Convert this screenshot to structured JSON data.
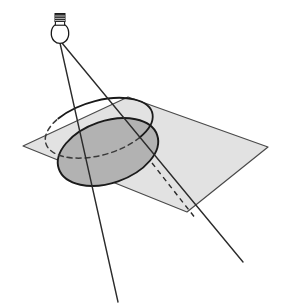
{
  "figure": {
    "background_color": "#ffffff",
    "width": 285,
    "height": 308
  },
  "colors": {
    "stroke": "#1a1a1a",
    "plane_fill": "#e2e2e2",
    "plane_stroke": "#4a4a4a",
    "shadow_fill": "#b2b2b2",
    "shadow_stroke": "#1a1a1a",
    "ring_stroke": "#1a1a1a",
    "ray_stroke": "#2b2b2b",
    "bulb_glass_fill": "#ffffff",
    "bulb_base_fill": "#2e2e2e"
  },
  "light_source": {
    "name": "light-bulb",
    "label": "light bulb",
    "position": {
      "x": 60,
      "y": 40
    },
    "glass": {
      "cx": 60,
      "cy": 35,
      "rx": 8.5,
      "ry": 9.5
    },
    "neck": {
      "x": 55.5,
      "y": 21,
      "width": 9,
      "height": 7
    },
    "base": {
      "x": 55,
      "y": 14,
      "width": 10,
      "height": 8
    },
    "base_ridges": [
      16,
      18.5,
      21
    ]
  },
  "plane": {
    "name": "ground-plane",
    "label": "plane",
    "corners": [
      {
        "x": 128,
        "y": 97
      },
      {
        "x": 268,
        "y": 147
      },
      {
        "x": 187,
        "y": 212
      },
      {
        "x": 23,
        "y": 146
      }
    ]
  },
  "ring": {
    "name": "circle-object",
    "label": "circle (object)",
    "center": {
      "x": 99,
      "y": 128
    },
    "rx": 45,
    "ry": 22,
    "rotation_deg": -16,
    "visible_arc": "M 58.3 118.5 A 45 22 -16 1 1 139.7 137.5",
    "hidden_arc": "M 139.7 137.5 A 45 22 -16 0 1 58.3 118.5"
  },
  "shadow": {
    "name": "shadow-ellipse",
    "label": "shadow (conic section)",
    "center": {
      "x": 108,
      "y": 152
    },
    "rx": 52,
    "ry": 31,
    "rotation_deg": -19
  },
  "rays": [
    {
      "name": "light-ray-left",
      "label": "tangent light ray (left)",
      "from": {
        "x": 60,
        "y": 43
      },
      "to": {
        "x": 118,
        "y": 302
      },
      "style": "solid"
    },
    {
      "name": "light-ray-right",
      "label": "tangent light ray (right)",
      "from": {
        "x": 62,
        "y": 43
      },
      "to": {
        "x": 243,
        "y": 262
      },
      "style": "solid"
    }
  ],
  "hidden_ray": {
    "name": "hidden-ray-segment",
    "label": "hidden portion of right ray",
    "from": {
      "x": 152,
      "y": 163
    },
    "to": {
      "x": 196,
      "y": 219
    },
    "style": "dashed",
    "dash_pattern": "5 4"
  },
  "annotations": {
    "description": "A light bulb above a plane. Two tangent rays from the bulb graze a tilted circle and meet the plane, producing a larger elliptical shadow on the plane surface."
  }
}
